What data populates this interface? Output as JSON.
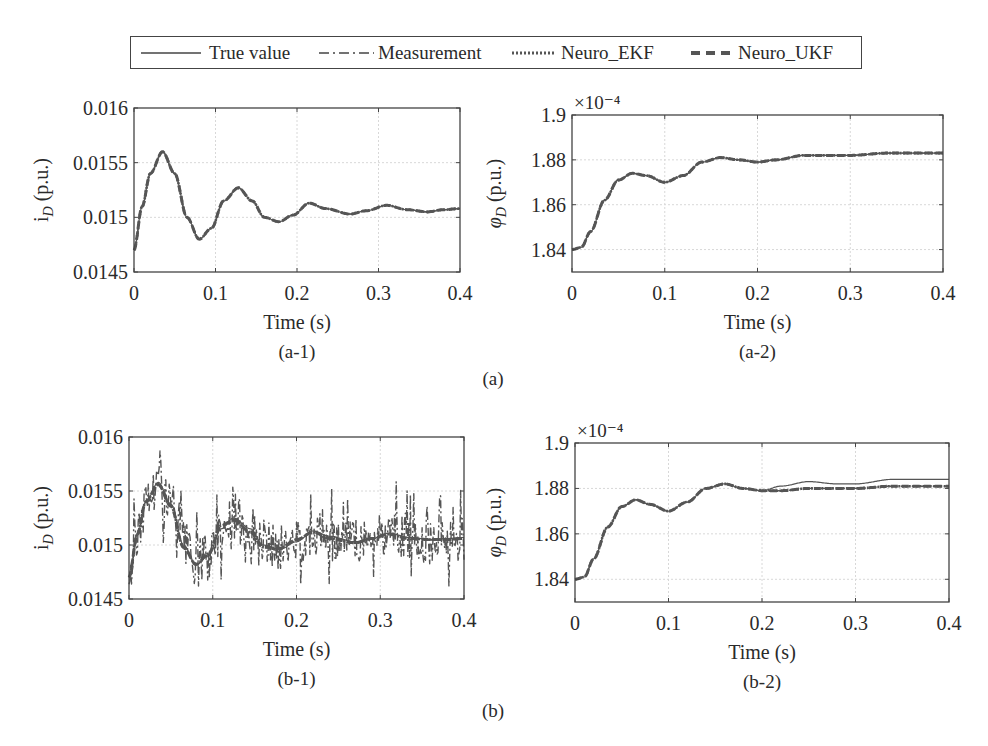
{
  "legend": {
    "entries": [
      {
        "label": "True value",
        "style": "solid"
      },
      {
        "label": "Measurement",
        "style": "dashdot"
      },
      {
        "label": "Neuro_EKF",
        "style": "dotted"
      },
      {
        "label": "Neuro_UKF",
        "style": "dashed"
      }
    ]
  },
  "groups": [
    {
      "label": "(a)"
    },
    {
      "label": "(b)"
    }
  ],
  "colors": {
    "line": "#555555",
    "axis": "#444444",
    "grid": "#d8d8d8",
    "text": "#2a2a2a"
  },
  "chart_data": [
    {
      "id": "a-1",
      "type": "line",
      "caption": "(a-1)",
      "title": "",
      "xlabel": "Time (s)",
      "ylabel": "i_D (p.u.)",
      "xlim": [
        0,
        0.4
      ],
      "ylim": [
        0.0145,
        0.016
      ],
      "xticks": [
        "0",
        "0.1",
        "0.2",
        "0.3",
        "0.4"
      ],
      "yticks": [
        "0.0145",
        "0.015",
        "0.0155",
        "0.016"
      ],
      "grid": true,
      "x": [
        0,
        0.01,
        0.02,
        0.035,
        0.05,
        0.065,
        0.08,
        0.095,
        0.11,
        0.128,
        0.145,
        0.16,
        0.178,
        0.195,
        0.215,
        0.235,
        0.265,
        0.285,
        0.31,
        0.335,
        0.36,
        0.38,
        0.4
      ],
      "series": [
        {
          "name": "True value",
          "values": [
            0.0147,
            0.0151,
            0.0154,
            0.0156,
            0.0154,
            0.015,
            0.0148,
            0.0149,
            0.01515,
            0.01527,
            0.01515,
            0.015,
            0.01496,
            0.01502,
            0.01513,
            0.01508,
            0.01503,
            0.01506,
            0.01511,
            0.01507,
            0.01505,
            0.01507,
            0.01508
          ]
        },
        {
          "name": "Measurement",
          "values": [
            0.0147,
            0.0151,
            0.0154,
            0.0156,
            0.0154,
            0.015,
            0.0148,
            0.0149,
            0.01515,
            0.01527,
            0.01515,
            0.015,
            0.01496,
            0.01502,
            0.01513,
            0.01508,
            0.01503,
            0.01506,
            0.01511,
            0.01507,
            0.01505,
            0.01507,
            0.01508
          ]
        },
        {
          "name": "Neuro_EKF",
          "values": [
            0.0147,
            0.0151,
            0.0154,
            0.0156,
            0.0154,
            0.015,
            0.0148,
            0.0149,
            0.01515,
            0.01527,
            0.01515,
            0.015,
            0.01496,
            0.01502,
            0.01513,
            0.01508,
            0.01503,
            0.01506,
            0.01511,
            0.01507,
            0.01505,
            0.01507,
            0.01508
          ]
        },
        {
          "name": "Neuro_UKF",
          "values": [
            0.0147,
            0.0151,
            0.0154,
            0.0156,
            0.0154,
            0.015,
            0.0148,
            0.0149,
            0.01515,
            0.01527,
            0.01515,
            0.015,
            0.01496,
            0.01502,
            0.01513,
            0.01508,
            0.01503,
            0.01506,
            0.01511,
            0.01507,
            0.01505,
            0.01507,
            0.01508
          ]
        }
      ]
    },
    {
      "id": "a-2",
      "type": "line",
      "caption": "(a-2)",
      "title": "",
      "xlabel": "Time (s)",
      "ylabel": "φ_D (p.u.)",
      "exponent_label": "×10⁻⁴",
      "xlim": [
        0,
        0.4
      ],
      "ylim": [
        1.83,
        1.9
      ],
      "xticks": [
        "0",
        "0.1",
        "0.2",
        "0.3",
        "0.4"
      ],
      "yticks": [
        "1.84",
        "1.86",
        "1.88",
        "1.9"
      ],
      "grid": true,
      "x": [
        0,
        0.01,
        0.02,
        0.035,
        0.05,
        0.065,
        0.08,
        0.1,
        0.12,
        0.14,
        0.16,
        0.18,
        0.2,
        0.22,
        0.25,
        0.28,
        0.3,
        0.34,
        0.37,
        0.4
      ],
      "series": [
        {
          "name": "True value",
          "values": [
            1.84,
            1.841,
            1.848,
            1.862,
            1.871,
            1.874,
            1.873,
            1.87,
            1.873,
            1.879,
            1.881,
            1.88,
            1.879,
            1.88,
            1.882,
            1.882,
            1.882,
            1.883,
            1.883,
            1.883
          ]
        },
        {
          "name": "Measurement",
          "values": [
            1.84,
            1.841,
            1.848,
            1.862,
            1.871,
            1.874,
            1.873,
            1.87,
            1.873,
            1.879,
            1.881,
            1.88,
            1.879,
            1.88,
            1.882,
            1.882,
            1.882,
            1.883,
            1.883,
            1.883
          ]
        },
        {
          "name": "Neuro_EKF",
          "values": [
            1.84,
            1.841,
            1.848,
            1.862,
            1.871,
            1.874,
            1.873,
            1.87,
            1.873,
            1.879,
            1.881,
            1.88,
            1.879,
            1.88,
            1.882,
            1.882,
            1.882,
            1.883,
            1.883,
            1.883
          ]
        },
        {
          "name": "Neuro_UKF",
          "values": [
            1.84,
            1.841,
            1.848,
            1.862,
            1.871,
            1.874,
            1.873,
            1.87,
            1.873,
            1.879,
            1.881,
            1.88,
            1.879,
            1.88,
            1.882,
            1.882,
            1.882,
            1.883,
            1.883,
            1.883
          ]
        }
      ]
    },
    {
      "id": "b-1",
      "type": "line",
      "caption": "(b-1)",
      "title": "",
      "xlabel": "Time (s)",
      "ylabel": "i_D (p.u.)",
      "xlim": [
        0,
        0.4
      ],
      "ylim": [
        0.0145,
        0.016
      ],
      "xticks": [
        "0",
        "0.1",
        "0.2",
        "0.3",
        "0.4"
      ],
      "yticks": [
        "0.0145",
        "0.015",
        "0.0155",
        "0.016"
      ],
      "grid": true,
      "x": [
        0,
        0.01,
        0.02,
        0.035,
        0.05,
        0.065,
        0.08,
        0.095,
        0.11,
        0.125,
        0.145,
        0.16,
        0.18,
        0.2,
        0.22,
        0.24,
        0.27,
        0.29,
        0.31,
        0.335,
        0.36,
        0.38,
        0.4
      ],
      "series": [
        {
          "name": "True value",
          "values": [
            0.0147,
            0.0151,
            0.0154,
            0.01558,
            0.01538,
            0.015,
            0.01482,
            0.0149,
            0.01515,
            0.01525,
            0.01515,
            0.015,
            0.01496,
            0.01503,
            0.01513,
            0.01508,
            0.01503,
            0.01506,
            0.01511,
            0.01507,
            0.01505,
            0.01506,
            0.01507
          ]
        },
        {
          "name": "Measurement",
          "values": [
            0.01465,
            0.01515,
            0.01545,
            0.0159,
            0.0153,
            0.0149,
            0.01455,
            0.01495,
            0.01535,
            0.0153,
            0.0152,
            0.0148,
            0.01475,
            0.01525,
            0.01535,
            0.015,
            0.01475,
            0.0152,
            0.01515,
            0.01475,
            0.01545,
            0.0148,
            0.01505
          ]
        },
        {
          "name": "Neuro_EKF",
          "values": [
            0.0147,
            0.0151,
            0.0154,
            0.01556,
            0.01536,
            0.01498,
            0.01482,
            0.01492,
            0.01518,
            0.01523,
            0.01512,
            0.01498,
            0.01497,
            0.01505,
            0.01512,
            0.01506,
            0.01502,
            0.01506,
            0.0151,
            0.01506,
            0.01505,
            0.01505,
            0.01506
          ]
        },
        {
          "name": "Neuro_UKF",
          "values": [
            0.0147,
            0.0151,
            0.0154,
            0.01556,
            0.01536,
            0.01498,
            0.01482,
            0.01492,
            0.01518,
            0.01523,
            0.01512,
            0.01498,
            0.01497,
            0.01505,
            0.01512,
            0.01506,
            0.01502,
            0.01506,
            0.0151,
            0.01506,
            0.01505,
            0.01505,
            0.01506
          ]
        }
      ]
    },
    {
      "id": "b-2",
      "type": "line",
      "caption": "(b-2)",
      "title": "",
      "xlabel": "Time (s)",
      "ylabel": "φ_D (p.u.)",
      "exponent_label": "×10⁻⁴",
      "xlim": [
        0,
        0.4
      ],
      "ylim": [
        1.83,
        1.9
      ],
      "xticks": [
        "0",
        "0.1",
        "0.2",
        "0.3",
        "0.4"
      ],
      "yticks": [
        "1.84",
        "1.86",
        "1.88",
        "1.9"
      ],
      "grid": true,
      "x": [
        0,
        0.01,
        0.02,
        0.035,
        0.05,
        0.065,
        0.08,
        0.1,
        0.12,
        0.14,
        0.16,
        0.18,
        0.2,
        0.22,
        0.25,
        0.28,
        0.3,
        0.34,
        0.37,
        0.4
      ],
      "series": [
        {
          "name": "True value",
          "values": [
            1.84,
            1.841,
            1.849,
            1.863,
            1.872,
            1.875,
            1.873,
            1.87,
            1.874,
            1.88,
            1.882,
            1.88,
            1.879,
            1.881,
            1.883,
            1.882,
            1.882,
            1.884,
            1.884,
            1.884
          ]
        },
        {
          "name": "Measurement",
          "values": [
            1.84,
            1.841,
            1.849,
            1.863,
            1.872,
            1.875,
            1.873,
            1.87,
            1.874,
            1.88,
            1.882,
            1.88,
            1.879,
            1.879,
            1.88,
            1.88,
            1.88,
            1.881,
            1.881,
            1.881
          ]
        },
        {
          "name": "Neuro_EKF",
          "values": [
            1.84,
            1.841,
            1.849,
            1.863,
            1.872,
            1.875,
            1.873,
            1.87,
            1.874,
            1.88,
            1.882,
            1.88,
            1.879,
            1.879,
            1.88,
            1.88,
            1.88,
            1.881,
            1.881,
            1.881
          ]
        },
        {
          "name": "Neuro_UKF",
          "values": [
            1.84,
            1.841,
            1.849,
            1.863,
            1.872,
            1.875,
            1.873,
            1.87,
            1.874,
            1.88,
            1.882,
            1.88,
            1.879,
            1.879,
            1.88,
            1.88,
            1.88,
            1.881,
            1.881,
            1.881
          ]
        }
      ]
    }
  ]
}
